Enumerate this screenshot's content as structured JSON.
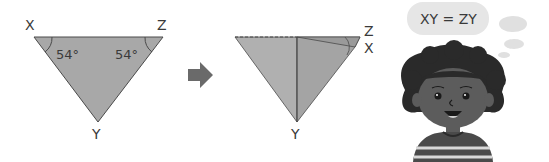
{
  "figure1": {
    "vertex_labels": {
      "x": "X",
      "z": "Z",
      "y": "Y"
    },
    "angle_x": "54°",
    "angle_z": "54°"
  },
  "arrow": {
    "icon": "right-arrow-icon"
  },
  "figure2": {
    "vertex_labels": {
      "z": "Z",
      "x": "X",
      "y": "Y"
    }
  },
  "thought_bubble": {
    "text": "XY = ZY"
  },
  "character": {
    "description": "girl-with-curly-hair"
  },
  "colors": {
    "triangle_fill": "#a8a8a8",
    "triangle_stroke": "#4a4a4a",
    "bubble_fill": "#e6e6e6",
    "arrow_fill": "#6a6a6a"
  }
}
